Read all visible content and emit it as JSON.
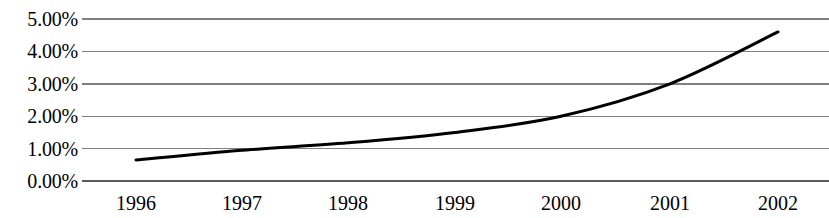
{
  "chart_data": {
    "type": "line",
    "title": "",
    "subtitle": "",
    "xlabel": "",
    "ylabel": "",
    "categories": [
      "1996",
      "1997",
      "1998",
      "1999",
      "2000",
      "2001",
      "2002"
    ],
    "values": [
      0.65,
      0.95,
      1.18,
      1.5,
      2.0,
      3.0,
      4.6
    ],
    "value_suffix": "%",
    "ylim": [
      0,
      5
    ],
    "y_ticks": [
      0,
      1,
      2,
      3,
      4,
      5
    ],
    "y_tick_labels": [
      "0.00%",
      "1.00%",
      "2.00%",
      "3.00%",
      "4.00%",
      "5.00%"
    ],
    "x_tick_labels": [
      "1996",
      "1997",
      "1998",
      "1999",
      "2000",
      "2001",
      "2002"
    ],
    "grid": true,
    "grid_axis": "y",
    "legend": false,
    "legend_position": "none",
    "series": [
      {
        "name": "",
        "values": [
          0.65,
          0.95,
          1.18,
          1.5,
          2.0,
          3.0,
          4.6
        ],
        "color": "#000000",
        "line_width": 3,
        "markers": false,
        "smooth": true
      }
    ],
    "colors": {
      "line": "#000000",
      "gridline": "#808080",
      "axis": "#595959",
      "background": "#ffffff",
      "text": "#000000"
    },
    "geometry": {
      "plot_left": 82,
      "plot_right": 829,
      "plot_top": 19,
      "plot_bottom": 181,
      "tick_x": [
        136,
        242,
        348,
        455,
        561,
        670,
        778
      ],
      "gridline_y": [
        19,
        51,
        84,
        116,
        149,
        181
      ]
    }
  }
}
